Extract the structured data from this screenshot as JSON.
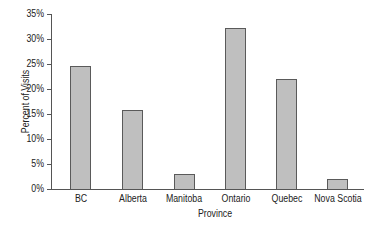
{
  "chart_data": {
    "type": "bar",
    "title": "",
    "xlabel": "Province",
    "ylabel": "Percent of Visits",
    "categories": [
      "BC",
      "Alberta",
      "Manitoba",
      "Ontario",
      "Quebec",
      "Nova Scotia"
    ],
    "values": [
      24.7,
      15.8,
      3.1,
      32.3,
      22.0,
      2.0
    ],
    "ylim": [
      0,
      35
    ],
    "yticks": [
      "0%",
      "5%",
      "10%",
      "15%",
      "20%",
      "25%",
      "30%",
      "35%"
    ],
    "grid": false,
    "legend": null,
    "colors": {
      "bar_fill": "#bfbfbf",
      "bar_edge": "#5a5a5a",
      "axis": "#555555"
    }
  }
}
